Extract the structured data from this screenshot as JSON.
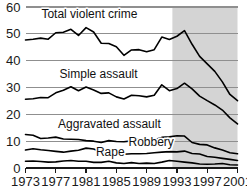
{
  "chart_data": {
    "type": "line",
    "title": "",
    "subtitle": "",
    "xlabel": "",
    "ylabel": "",
    "xlim": [
      1973,
      2001
    ],
    "ylim": [
      0,
      60
    ],
    "y_ticks": [
      0,
      10,
      20,
      30,
      40,
      50,
      60
    ],
    "x_ticks": [
      1973,
      1977,
      1981,
      1985,
      1989,
      1993,
      1997,
      2001
    ],
    "x_tick_labels": [
      "1973",
      "1977",
      "1981",
      "1985",
      "1989",
      "1993",
      "1997",
      "2001"
    ],
    "y_tick_labels": [
      "0",
      "10",
      "20",
      "30",
      "40",
      "50",
      "60"
    ],
    "grid": "horizontal",
    "legend_position": "inline-annotations",
    "shaded_region": {
      "start": 1992.4,
      "end": 2001,
      "color": "#d4d4d4",
      "label": ""
    },
    "x": [
      1973,
      1974,
      1975,
      1976,
      1977,
      1978,
      1979,
      1980,
      1981,
      1982,
      1983,
      1984,
      1985,
      1986,
      1987,
      1988,
      1989,
      1990,
      1991,
      1992,
      1993,
      1994,
      1995,
      1996,
      1997,
      1998,
      1999,
      2000,
      2001
    ],
    "series": [
      {
        "name": "Total violent crime",
        "color": "#000000",
        "label_x": 1975.1,
        "label_y": 56.0,
        "values": [
          47.7,
          48.0,
          48.4,
          48.0,
          50.4,
          50.6,
          51.7,
          49.4,
          52.3,
          50.7,
          46.5,
          46.4,
          45.2,
          42.0,
          44.0,
          44.1,
          43.3,
          44.1,
          48.8,
          47.9,
          49.1,
          51.2,
          46.1,
          41.6,
          38.8,
          36.0,
          32.1,
          27.4,
          25.1
        ]
      },
      {
        "name": "Simple assault",
        "color": "#000000",
        "label_x": 1977.5,
        "label_y": 33.5,
        "values": [
          25.6,
          25.8,
          26.3,
          26.2,
          28.0,
          29.0,
          30.3,
          28.8,
          30.2,
          29.1,
          27.8,
          28.0,
          26.5,
          25.7,
          27.1,
          26.9,
          26.5,
          27.1,
          31.0,
          28.8,
          29.6,
          31.6,
          29.5,
          26.8,
          25.1,
          23.5,
          21.6,
          18.7,
          16.4
        ]
      },
      {
        "name": "Aggravated assault",
        "color": "#000000",
        "label_x": 1977.3,
        "label_y": 14.8,
        "values": [
          12.5,
          12.2,
          11.0,
          11.2,
          11.5,
          10.8,
          10.7,
          10.6,
          10.2,
          10.0,
          9.5,
          10.2,
          9.9,
          9.8,
          10.1,
          10.9,
          10.7,
          10.5,
          11.4,
          11.6,
          12.0,
          11.9,
          9.5,
          8.8,
          8.6,
          7.5,
          6.7,
          5.7,
          5.3
        ]
      },
      {
        "name": "Robbery",
        "color": "#000000",
        "label_x": 1986.6,
        "label_y": 8.2,
        "values": [
          6.7,
          7.2,
          6.8,
          6.5,
          6.2,
          5.9,
          6.3,
          6.6,
          7.4,
          7.1,
          6.0,
          5.8,
          5.1,
          5.1,
          5.3,
          5.3,
          5.4,
          5.7,
          5.9,
          6.1,
          6.0,
          6.3,
          5.4,
          5.2,
          4.3,
          4.0,
          3.6,
          3.2,
          2.8
        ]
      },
      {
        "name": "Rape",
        "color": "#000000",
        "label_x": 1982.3,
        "label_y": 4.6,
        "values": [
          2.5,
          2.6,
          2.4,
          2.2,
          2.3,
          2.6,
          2.8,
          2.5,
          2.5,
          2.1,
          2.1,
          2.5,
          1.9,
          1.7,
          2.0,
          1.7,
          1.8,
          1.7,
          2.2,
          2.8,
          2.5,
          2.2,
          1.9,
          1.5,
          1.4,
          1.5,
          1.7,
          1.2,
          1.1
        ]
      }
    ]
  }
}
